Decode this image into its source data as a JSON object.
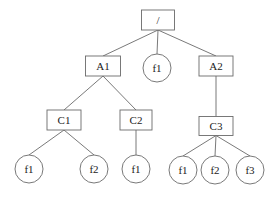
{
  "diagram": {
    "type": "tree",
    "nodes": [
      {
        "id": "root",
        "label": "/",
        "shape": "rect",
        "x": 158,
        "y": 20,
        "w": 33,
        "h": 20
      },
      {
        "id": "A1",
        "label": "A1",
        "shape": "rect",
        "x": 103,
        "y": 66,
        "w": 35,
        "h": 20
      },
      {
        "id": "root_f1",
        "label": "f1",
        "shape": "circle",
        "x": 157,
        "y": 68,
        "r": 14
      },
      {
        "id": "A2",
        "label": "A2",
        "shape": "rect",
        "x": 216,
        "y": 66,
        "w": 34,
        "h": 20
      },
      {
        "id": "C1",
        "label": "C1",
        "shape": "rect",
        "x": 64,
        "y": 120,
        "w": 34,
        "h": 20
      },
      {
        "id": "C2",
        "label": "C2",
        "shape": "rect",
        "x": 136,
        "y": 120,
        "w": 32,
        "h": 20
      },
      {
        "id": "C3",
        "label": "C3",
        "shape": "rect",
        "x": 216,
        "y": 126,
        "w": 34,
        "h": 19
      },
      {
        "id": "C1_f1",
        "label": "f1",
        "shape": "circle",
        "x": 29,
        "y": 169,
        "r": 14
      },
      {
        "id": "C1_f2",
        "label": "f2",
        "shape": "circle",
        "x": 94,
        "y": 169,
        "r": 14
      },
      {
        "id": "C2_f1",
        "label": "f1",
        "shape": "circle",
        "x": 136,
        "y": 169,
        "r": 14
      },
      {
        "id": "C3_f1",
        "label": "f1",
        "shape": "circle",
        "x": 183,
        "y": 170,
        "r": 14
      },
      {
        "id": "C3_f2",
        "label": "f2",
        "shape": "circle",
        "x": 215,
        "y": 170,
        "r": 14
      },
      {
        "id": "C3_f3",
        "label": "f3",
        "shape": "circle",
        "x": 250,
        "y": 170,
        "r": 14
      }
    ],
    "edges": [
      [
        "root",
        "A1"
      ],
      [
        "root",
        "root_f1"
      ],
      [
        "root",
        "A2"
      ],
      [
        "A1",
        "C1"
      ],
      [
        "A1",
        "C2"
      ],
      [
        "A2",
        "C3"
      ],
      [
        "C1",
        "C1_f1"
      ],
      [
        "C1",
        "C1_f2"
      ],
      [
        "C2",
        "C2_f1"
      ],
      [
        "C3",
        "C3_f1"
      ],
      [
        "C3",
        "C3_f2"
      ],
      [
        "C3",
        "C3_f3"
      ]
    ]
  }
}
